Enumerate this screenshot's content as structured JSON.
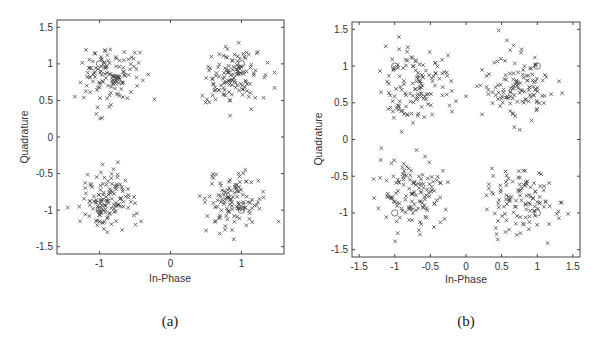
{
  "chart_data": [
    {
      "type": "scatter",
      "panel": "a",
      "caption": "(a)",
      "title": "",
      "xlabel": "In-Phase",
      "ylabel": "Quadrature",
      "xlim": [
        -1.6,
        1.6
      ],
      "ylim": [
        -1.6,
        1.6
      ],
      "xticks": [
        -1,
        0,
        1
      ],
      "xtick_labels": [
        "-1",
        "0",
        "1"
      ],
      "yticks": [
        1.5,
        1,
        0.5,
        0,
        -0.5,
        -1,
        -1.5
      ],
      "ytick_labels": [
        "1.5",
        "1",
        "0.5",
        "0",
        "-0.5",
        "-1",
        "-1.5"
      ],
      "grid": false,
      "legend": null,
      "marker": "x",
      "reference_points": [
        [
          -1,
          1
        ],
        [
          1,
          1
        ],
        [
          -1,
          -1
        ],
        [
          1,
          -1
        ]
      ],
      "clusters": [
        {
          "center": [
            -0.85,
            0.82
          ],
          "spread": 0.25,
          "count": 130
        },
        {
          "center": [
            0.85,
            0.82
          ],
          "spread": 0.25,
          "count": 130
        },
        {
          "center": [
            -0.85,
            -0.85
          ],
          "spread": 0.25,
          "count": 130
        },
        {
          "center": [
            0.9,
            -0.88
          ],
          "spread": 0.25,
          "count": 120
        }
      ],
      "seed": 7
    },
    {
      "type": "scatter",
      "panel": "b",
      "caption": "(b)",
      "title": "",
      "xlabel": "In-Phase",
      "ylabel": "Quadrature",
      "xlim": [
        -1.6,
        1.6
      ],
      "ylim": [
        -1.6,
        1.6
      ],
      "xticks": [
        -1.5,
        -1,
        -0.5,
        0,
        0.5,
        1,
        1.5
      ],
      "xtick_labels": [
        "-1.5",
        "-1",
        "-0.5",
        "0",
        "0.5",
        "1",
        "1.5"
      ],
      "yticks": [
        1.5,
        1,
        0.5,
        0,
        -0.5,
        -1,
        -1.5
      ],
      "ytick_labels": [
        "1.5",
        "1",
        "0.5",
        "0",
        "-0.5",
        "-1",
        "-1.5"
      ],
      "grid": false,
      "legend": null,
      "marker": "x",
      "reference_points": [
        [
          -1,
          1
        ],
        [
          1,
          1
        ],
        [
          -1,
          -1
        ],
        [
          1,
          -1
        ]
      ],
      "clusters": [
        {
          "center": [
            -0.7,
            0.72
          ],
          "spread": 0.32,
          "count": 130
        },
        {
          "center": [
            0.75,
            0.72
          ],
          "spread": 0.3,
          "count": 125
        },
        {
          "center": [
            -0.75,
            -0.72
          ],
          "spread": 0.32,
          "count": 130
        },
        {
          "center": [
            0.75,
            -0.8
          ],
          "spread": 0.3,
          "count": 115
        }
      ],
      "seed": 19
    }
  ],
  "panels": {
    "a": {
      "caption": "(a)",
      "xlabel": "In-Phase",
      "ylabel": "Quadrature"
    },
    "b": {
      "caption": "(b)",
      "xlabel": "In-Phase",
      "ylabel": "Quadrature"
    }
  },
  "colors": {
    "marker": "#444444",
    "frame": "#444444",
    "text": "#333333"
  }
}
